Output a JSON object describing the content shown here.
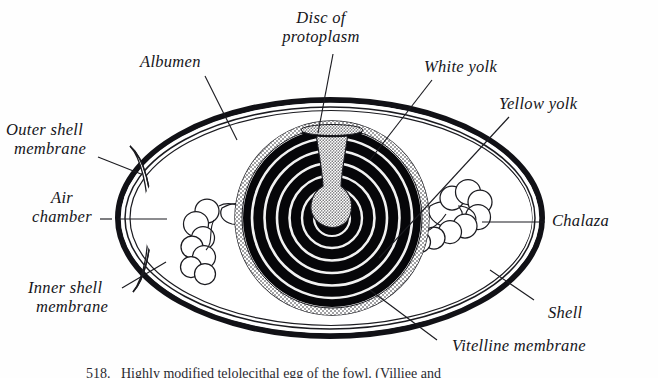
{
  "figure": {
    "caption": "518.   Highly modified telolecithal egg of the fowl. (Villiee and"
  },
  "labels": {
    "albumen": "Albumen",
    "disc_of_protoplasm_line1": "Disc of",
    "disc_of_protoplasm_line2": "protoplasm",
    "white_yolk": "White yolk",
    "yellow_yolk": "Yellow yolk",
    "outer_shell_membrane_line1": "Outer shell",
    "outer_shell_membrane_line2": "membrane",
    "air_chamber_line1": "Air",
    "air_chamber_line2": "chamber",
    "inner_shell_membrane_line1": "Inner shell",
    "inner_shell_membrane_line2": "membrane",
    "chalaza": "Chalaza",
    "shell": "Shell",
    "vitelline_membrane": "Vitelline membrane"
  },
  "colors": {
    "ink": "#15151a",
    "paper": "#fefefe",
    "shell_fill": "#111116",
    "yolk_dark": "#050508",
    "leader_line": "#1b1b20"
  },
  "structure": {
    "parts": [
      "shell",
      "outer shell membrane",
      "inner shell membrane",
      "air chamber",
      "albumen",
      "chalaza",
      "vitelline membrane",
      "yellow yolk",
      "white yolk",
      "disc of protoplasm"
    ],
    "yolk_ring_count": 6
  }
}
